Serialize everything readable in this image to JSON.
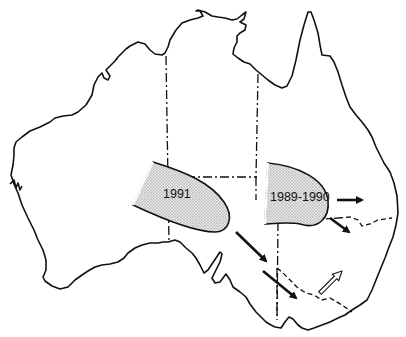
{
  "map": {
    "subject": "Australia",
    "regions": [
      {
        "id": "region-1991",
        "label": "1991"
      },
      {
        "id": "region-1989-1990",
        "label": "1989-1990"
      }
    ],
    "arrows": [
      {
        "type": "solid",
        "direction": "east"
      },
      {
        "type": "solid",
        "direction": "southeast"
      },
      {
        "type": "solid",
        "direction": "southeast"
      },
      {
        "type": "solid",
        "direction": "southeast"
      },
      {
        "type": "hollow",
        "direction": "northeast"
      }
    ],
    "colors": {
      "outline": "#111111",
      "region_fill": "#d4d4d4",
      "background": "#ffffff"
    }
  }
}
